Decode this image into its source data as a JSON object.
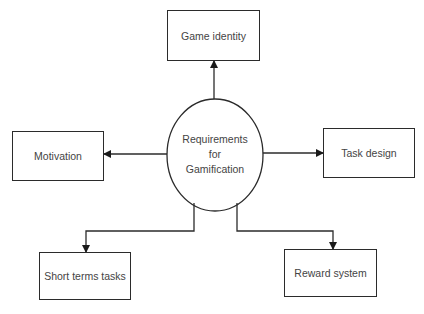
{
  "diagram": {
    "center": {
      "lines": [
        "Requirements",
        "for",
        "Gamification"
      ]
    },
    "nodes": {
      "top": {
        "label": "Game identity"
      },
      "left": {
        "label": "Motivation"
      },
      "right": {
        "label": "Task design"
      },
      "bottom_left": {
        "label": "Short terms tasks"
      },
      "bottom_right": {
        "label": "Reward system"
      }
    },
    "edges": [
      {
        "from": "Requirements for Gamification",
        "to": "Game identity"
      },
      {
        "from": "Requirements for Gamification",
        "to": "Motivation"
      },
      {
        "from": "Requirements for Gamification",
        "to": "Task design"
      },
      {
        "from": "Requirements for Gamification",
        "to": "Short terms tasks"
      },
      {
        "from": "Requirements for Gamification",
        "to": "Reward system"
      }
    ],
    "colors": {
      "stroke": "#2b2b2b",
      "text": "#444444",
      "background": "#ffffff"
    }
  }
}
